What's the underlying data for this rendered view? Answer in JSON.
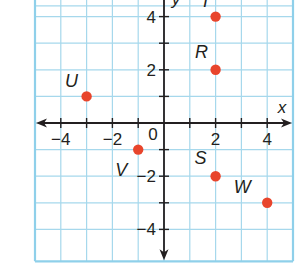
{
  "chart_data": {
    "type": "scatter",
    "title": "",
    "xlabel": "x",
    "ylabel": "y",
    "xlim": [
      -5,
      5
    ],
    "ylim": [
      -5,
      4.5
    ],
    "grid": true,
    "x_ticks": [
      -4,
      -3,
      -2,
      -1,
      0,
      1,
      2,
      3,
      4
    ],
    "x_tick_labels": [
      "-4",
      "-2",
      "0",
      "2",
      "4"
    ],
    "y_ticks": [
      -4,
      -3,
      -2,
      -1,
      1,
      2,
      3,
      4
    ],
    "y_tick_labels": [
      "-4",
      "-2",
      "2",
      "4"
    ],
    "origin_label": "0",
    "points": [
      {
        "label": "T",
        "x": 2,
        "y": 4
      },
      {
        "label": "R",
        "x": 2,
        "y": 2
      },
      {
        "label": "U",
        "x": -3,
        "y": 1
      },
      {
        "label": "V",
        "x": -1,
        "y": -1
      },
      {
        "label": "S",
        "x": 2,
        "y": -2
      },
      {
        "label": "W",
        "x": 4,
        "y": -3
      }
    ],
    "colors": {
      "point": "#e8452c",
      "grid": "#a6d8ec",
      "border": "#8fd0ea",
      "axis": "#231f20"
    }
  }
}
